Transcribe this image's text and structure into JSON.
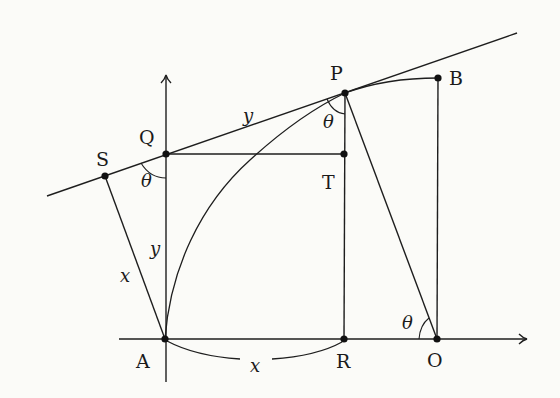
{
  "diagram": {
    "colors": {
      "background": "#fbfbf8",
      "ink": "#1e1e1e"
    },
    "points": {
      "A": {
        "label": "A",
        "x": 165,
        "y": 339
      },
      "B": {
        "label": "B",
        "x": 438,
        "y": 78
      },
      "O": {
        "label": "O",
        "x": 437,
        "y": 339
      },
      "P": {
        "label": "P",
        "x": 345,
        "y": 93
      },
      "Q": {
        "label": "Q",
        "x": 166,
        "y": 154
      },
      "R": {
        "label": "R",
        "x": 344,
        "y": 339
      },
      "S": {
        "label": "S",
        "x": 105,
        "y": 176
      },
      "T": {
        "label": "T",
        "x": 344,
        "y": 154
      }
    },
    "variables": {
      "theta_Q": "θ",
      "theta_P": "θ",
      "theta_O": "θ",
      "y_QP": "y",
      "y_QA": "y",
      "x_SA": "x",
      "x_AR": "x"
    },
    "axes": {
      "x_axis": {
        "from": [
          119,
          339
        ],
        "to": [
          527,
          339
        ],
        "arrow": true
      },
      "y_axis": {
        "from": [
          166,
          382
        ],
        "to": [
          166,
          75
        ],
        "arrow": true
      }
    },
    "segments": [
      {
        "name": "tangent-line",
        "from": [
          47,
          196
        ],
        "to": [
          517,
          33
        ]
      },
      {
        "name": "QT",
        "from": "Q",
        "to": "T"
      },
      {
        "name": "PR",
        "from": "P",
        "to": "R"
      },
      {
        "name": "BO",
        "from": "B",
        "to": "O"
      },
      {
        "name": "PO",
        "from": "P",
        "to": "O"
      },
      {
        "name": "SA",
        "from": "S",
        "to": "A"
      }
    ]
  }
}
